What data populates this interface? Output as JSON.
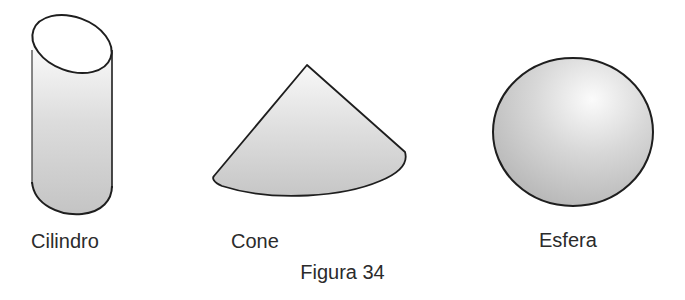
{
  "figure": {
    "caption": "Figura 34",
    "shapes": [
      {
        "id": "cilindro",
        "label": "Cilindro"
      },
      {
        "id": "cone",
        "label": "Cone"
      },
      {
        "id": "esfera",
        "label": "Esfera"
      }
    ]
  },
  "colors": {
    "stroke": "#1e1e1e",
    "fill_light": "#f4f4f4",
    "fill_dark": "#bdbdbd",
    "background": "#ffffff",
    "text": "#2b2b2b"
  }
}
